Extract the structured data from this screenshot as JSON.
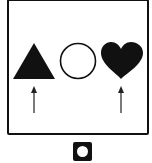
{
  "figure": {
    "type": "shape-sequence-puzzle",
    "shapes": [
      {
        "name": "triangle",
        "fill": "filled",
        "color": "#111111",
        "marked_by_arrow": true
      },
      {
        "name": "circle",
        "fill": "outline",
        "color": "#111111",
        "marked_by_arrow": false
      },
      {
        "name": "heart",
        "fill": "filled",
        "color": "#111111",
        "marked_by_arrow": true
      }
    ],
    "arrows": [
      {
        "under": "triangle",
        "direction": "up"
      },
      {
        "under": "heart",
        "direction": "up"
      }
    ]
  },
  "answer_icon": {
    "name": "square-with-circle",
    "outer_color": "#111111",
    "inner_color": "#ffffff"
  }
}
